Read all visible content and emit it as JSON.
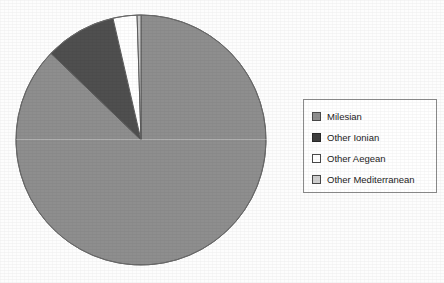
{
  "chart_data": {
    "type": "pie",
    "title": "",
    "subtitle": "",
    "xlabel": "",
    "ylabel": "",
    "grid": false,
    "legend_position": "right",
    "categories": [
      "Milesian",
      "Other Ionian",
      "Other Aegean",
      "Other Mediterranean"
    ],
    "values": [
      87.2,
      9.2,
      3.1,
      0.5
    ],
    "units": "percent",
    "start_angle_deg": 0,
    "direction": "clockwise",
    "slices": [
      {
        "label": "Milesian",
        "value": 87.2,
        "color": "#8e8e8e",
        "angle_deg": 313.9
      },
      {
        "label": "Other Ionian",
        "value": 9.2,
        "color": "#4f4f4f",
        "angle_deg": 33.1
      },
      {
        "label": "Other Aegean",
        "value": 3.1,
        "color": "#ffffff",
        "angle_deg": 11.2
      },
      {
        "label": "Other Mediterranean",
        "value": 0.5,
        "color": "#c9c9c9",
        "angle_deg": 1.8
      }
    ],
    "annotations": []
  },
  "pie": {
    "center_x": 126,
    "center_y": 126,
    "radius": 125,
    "outline_color": "#6b6b6b"
  },
  "legend": {
    "border_color": "#8c8c8c",
    "background": "#ffffff",
    "items": [
      {
        "label": "Milesian",
        "color": "#8e8e8e",
        "swatch_border": "#4a4a4a"
      },
      {
        "label": "Other Ionian",
        "color": "#3f3f3f",
        "swatch_border": "#2a2a2a"
      },
      {
        "label": "Other Aegean",
        "color": "#ffffff",
        "swatch_border": "#4a4a4a"
      },
      {
        "label": "Other Mediterranean",
        "color": "#cfcfcf",
        "swatch_border": "#4a4a4a"
      }
    ]
  },
  "page": {
    "background": "#fdfdfd"
  }
}
